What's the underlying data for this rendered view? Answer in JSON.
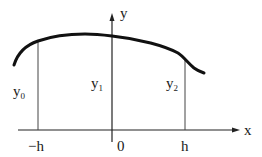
{
  "diagram": {
    "type": "function-sampling-figure",
    "axes": {
      "x_label": "x",
      "y_label": "y"
    },
    "ticks": [
      {
        "label": "−h",
        "x": -1
      },
      {
        "label": "0",
        "x": 0
      },
      {
        "label": "h",
        "x": 1
      }
    ],
    "ordinates": [
      {
        "base": "y",
        "sub": "0",
        "at": "−h"
      },
      {
        "base": "y",
        "sub": "1",
        "at": "0"
      },
      {
        "base": "y",
        "sub": "2",
        "at": "h"
      }
    ],
    "curve": {
      "description": "smooth curve rising from left, gently peaking near the y-axis, descending to the right with a small tail past x=h"
    }
  }
}
